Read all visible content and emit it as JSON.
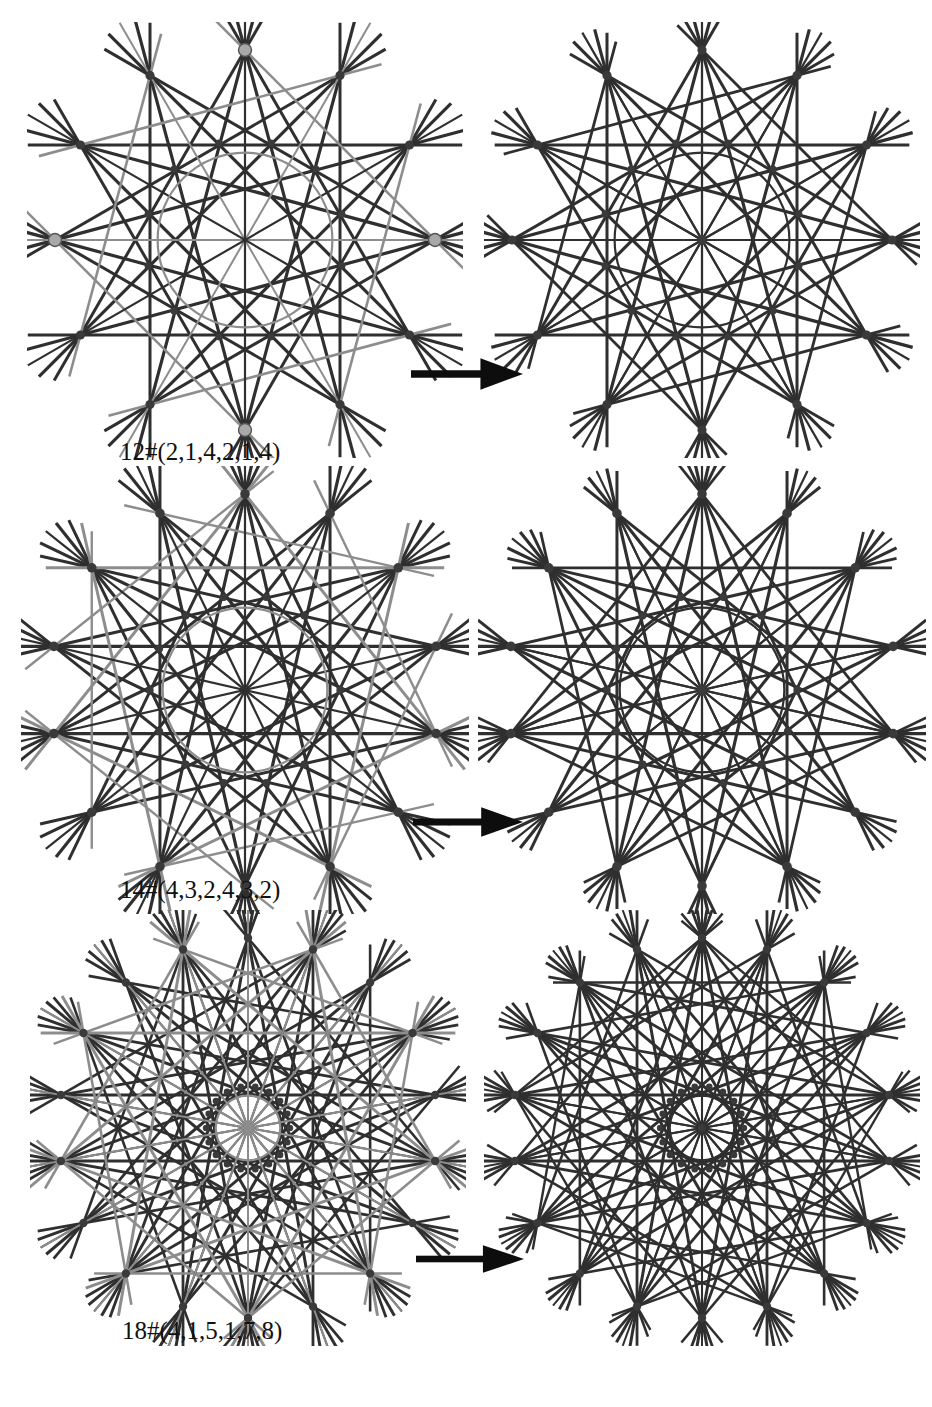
{
  "document": {
    "kind": "figure-plate",
    "background_color": "#ffffff",
    "width": 932,
    "height": 1407
  },
  "colors": {
    "dark_line": "#2f2f2f",
    "gray_line": "#8d8d8d",
    "light_gray_line": "#9a9a9a",
    "vertex_dark": "#3a3a3a",
    "vertex_light": "#a8a8a8",
    "vertex_light_stroke": "#555555",
    "arrow": "#0d0d0d",
    "caption": "#111111"
  },
  "arrow": {
    "name": "right-arrow",
    "glyph": "→"
  },
  "rows": [
    {
      "id": "row-1",
      "caption": "12#(2,1,4,2,1,4)",
      "symmetry": 12,
      "left": {
        "name": "arrangement-12-two-color",
        "cx": 245,
        "cy": 240,
        "r": 190,
        "n": 12,
        "rotation": -90,
        "inner_radius_ratio": 0.46,
        "extension": 0.16,
        "families": [
          {
            "name": "dark-chords-step-5",
            "color": "#2f2f2f",
            "width": 3.2,
            "step": 5,
            "indices": [
              0,
              1,
              2,
              3,
              4,
              5,
              6,
              7,
              8,
              9,
              10,
              11
            ]
          },
          {
            "name": "dark-chords-step-4",
            "color": "#2f2f2f",
            "width": 3.0,
            "step": 4,
            "indices": [
              0,
              1,
              2,
              3,
              4,
              5,
              6,
              7,
              8,
              9,
              10,
              11
            ]
          },
          {
            "name": "gray-chords-step-3",
            "color": "#8d8d8d",
            "width": 2.6,
            "step": 3,
            "indices": [
              0,
              2,
              4,
              6,
              8,
              10
            ]
          },
          {
            "name": "gray-axis-lines",
            "color": "#8d8d8d",
            "width": 2.0,
            "step": 6,
            "indices": [
              1,
              3,
              5,
              7,
              9,
              11
            ]
          },
          {
            "name": "dark-axis-lines",
            "color": "#2f2f2f",
            "width": 2.2,
            "step": 6,
            "indices": [
              0,
              2,
              4,
              6,
              8,
              10
            ]
          }
        ],
        "markers_light": [
          0,
          3,
          6,
          9
        ],
        "marker_light_r": 6.5,
        "marker_dark_r": 4.6
      },
      "right": {
        "name": "arrangement-12-unified",
        "cx": 702,
        "cy": 240,
        "r": 190,
        "n": 12,
        "rotation": -90,
        "inner_radius_ratio": 0.46,
        "extension": 0.13,
        "central_pencil": true,
        "families": [
          {
            "name": "dark-chords-step-5",
            "color": "#2f2f2f",
            "width": 3.2,
            "step": 5,
            "indices": [
              0,
              1,
              2,
              3,
              4,
              5,
              6,
              7,
              8,
              9,
              10,
              11
            ]
          },
          {
            "name": "dark-chords-step-4",
            "color": "#2f2f2f",
            "width": 3.0,
            "step": 4,
            "indices": [
              0,
              1,
              2,
              3,
              4,
              5,
              6,
              7,
              8,
              9,
              10,
              11
            ]
          },
          {
            "name": "dark-chords-step-3",
            "color": "#2f2f2f",
            "width": 2.8,
            "step": 3,
            "indices": [
              0,
              2,
              4,
              6,
              8,
              10
            ]
          },
          {
            "name": "dark-axis-lines",
            "color": "#2f2f2f",
            "width": 2.2,
            "step": 6,
            "indices": [
              0,
              1,
              2,
              3,
              4,
              5,
              6,
              7,
              8,
              9,
              10,
              11
            ]
          }
        ],
        "markers_light": [],
        "marker_light_r": 6.0,
        "marker_dark_r": 4.6
      },
      "arrow_box": {
        "x": 411,
        "y": 357,
        "w": 112,
        "h": 34
      }
    },
    {
      "id": "row-2",
      "caption": "14#(4,3,2,4,3,2)",
      "symmetry": 14,
      "left": {
        "name": "arrangement-14-two-color",
        "cx": 245,
        "cy": 690,
        "r": 196,
        "n": 14,
        "rotation": -90,
        "inner_radius_ratio": 0.42,
        "extension": 0.15,
        "families": [
          {
            "name": "dark-chords-step-6",
            "color": "#2f2f2f",
            "width": 3.2,
            "step": 6,
            "indices": [
              0,
              1,
              2,
              3,
              4,
              5,
              6,
              7,
              8,
              9,
              10,
              11,
              12,
              13
            ]
          },
          {
            "name": "dark-chords-step-5",
            "color": "#2f2f2f",
            "width": 3.0,
            "step": 5,
            "indices": [
              0,
              1,
              2,
              3,
              4,
              5,
              6,
              7,
              8,
              9,
              10,
              11,
              12,
              13
            ]
          },
          {
            "name": "gray-chords-step-4",
            "color": "#8d8d8d",
            "width": 3.0,
            "step": 4,
            "indices": [
              0,
              2,
              4,
              6,
              8,
              10,
              12
            ]
          },
          {
            "name": "gray-chords-step-3",
            "color": "#8d8d8d",
            "width": 2.4,
            "step": 3,
            "indices": [
              1,
              3,
              5,
              7,
              9,
              11,
              13
            ]
          },
          {
            "name": "dark-axis-lines",
            "color": "#2f2f2f",
            "width": 2.2,
            "step": 7,
            "indices": [
              0,
              1,
              2,
              3,
              4,
              5,
              6,
              7,
              8,
              9,
              10,
              11,
              12,
              13
            ]
          }
        ],
        "markers_light": [],
        "marker_light_r": 6.0,
        "marker_dark_r": 4.8
      },
      "right": {
        "name": "arrangement-14-unified",
        "cx": 702,
        "cy": 690,
        "r": 196,
        "n": 14,
        "rotation": -90,
        "inner_radius_ratio": 0.42,
        "extension": 0.12,
        "central_pencil": true,
        "families": [
          {
            "name": "dark-chords-step-6",
            "color": "#2f2f2f",
            "width": 3.2,
            "step": 6,
            "indices": [
              0,
              1,
              2,
              3,
              4,
              5,
              6,
              7,
              8,
              9,
              10,
              11,
              12,
              13
            ]
          },
          {
            "name": "dark-chords-step-5",
            "color": "#2f2f2f",
            "width": 3.0,
            "step": 5,
            "indices": [
              0,
              1,
              2,
              3,
              4,
              5,
              6,
              7,
              8,
              9,
              10,
              11,
              12,
              13
            ]
          },
          {
            "name": "dark-chords-step-4",
            "color": "#2f2f2f",
            "width": 2.8,
            "step": 4,
            "indices": [
              0,
              2,
              4,
              6,
              8,
              10,
              12
            ]
          },
          {
            "name": "dark-axis-lines",
            "color": "#2f2f2f",
            "width": 2.2,
            "step": 7,
            "indices": [
              0,
              1,
              2,
              3,
              4,
              5,
              6,
              7,
              8,
              9,
              10,
              11,
              12,
              13
            ]
          }
        ],
        "markers_light": [],
        "marker_light_r": 6.0,
        "marker_dark_r": 4.8
      },
      "arrow_box": {
        "x": 413,
        "y": 806,
        "w": 110,
        "h": 32
      }
    },
    {
      "id": "row-3",
      "caption": "18#(4,1,5,1,7,8)",
      "symmetry": 18,
      "left": {
        "name": "arrangement-18-two-color",
        "cx": 248,
        "cy": 1128,
        "r": 190,
        "n": 18,
        "rotation": -90,
        "inner_radius_ratio": 0.17,
        "extension": 0.13,
        "families": [
          {
            "name": "dark-chords-step-8",
            "color": "#2f2f2f",
            "width": 3.0,
            "step": 8,
            "indices": [
              0,
              1,
              2,
              3,
              4,
              5,
              6,
              7,
              8,
              9,
              10,
              11,
              12,
              13,
              14,
              15,
              16,
              17
            ]
          },
          {
            "name": "dark-chords-step-7",
            "color": "#2f2f2f",
            "width": 2.8,
            "step": 7,
            "indices": [
              0,
              1,
              2,
              3,
              4,
              5,
              6,
              7,
              8,
              9,
              10,
              11,
              12,
              13,
              14,
              15,
              16,
              17
            ]
          },
          {
            "name": "dark-chords-step-5",
            "color": "#2f2f2f",
            "width": 2.6,
            "step": 5,
            "indices": [
              0,
              2,
              4,
              6,
              8,
              10,
              12,
              14,
              16
            ]
          },
          {
            "name": "gray-chords-step-6",
            "color": "#8d8d8d",
            "width": 3.0,
            "step": 6,
            "indices": [
              1,
              3,
              5,
              7,
              9,
              11,
              13,
              15,
              17
            ]
          },
          {
            "name": "gray-chords-step-4",
            "color": "#8d8d8d",
            "width": 2.6,
            "step": 4,
            "indices": [
              1,
              3,
              5,
              7,
              9,
              11,
              13,
              15,
              17
            ]
          },
          {
            "name": "dark-axis-lines",
            "color": "#2f2f2f",
            "width": 2.0,
            "step": 9,
            "indices": [
              0,
              2,
              4,
              6,
              8,
              10,
              12,
              14,
              16
            ]
          },
          {
            "name": "gray-axis-lines",
            "color": "#8d8d8d",
            "width": 2.0,
            "step": 9,
            "indices": [
              1,
              3,
              5,
              7,
              9,
              11,
              13,
              15,
              17
            ]
          }
        ],
        "markers_light": [],
        "marker_light_r": 5.5,
        "marker_dark_r": 4.2
      },
      "right": {
        "name": "arrangement-18-unified",
        "cx": 702,
        "cy": 1128,
        "r": 190,
        "n": 18,
        "rotation": -90,
        "inner_radius_ratio": 0.17,
        "extension": 0.11,
        "central_pencil": true,
        "families": [
          {
            "name": "dark-chords-step-8",
            "color": "#2f2f2f",
            "width": 3.0,
            "step": 8,
            "indices": [
              0,
              1,
              2,
              3,
              4,
              5,
              6,
              7,
              8,
              9,
              10,
              11,
              12,
              13,
              14,
              15,
              16,
              17
            ]
          },
          {
            "name": "dark-chords-step-7",
            "color": "#2f2f2f",
            "width": 2.8,
            "step": 7,
            "indices": [
              0,
              1,
              2,
              3,
              4,
              5,
              6,
              7,
              8,
              9,
              10,
              11,
              12,
              13,
              14,
              15,
              16,
              17
            ]
          },
          {
            "name": "dark-chords-step-5",
            "color": "#2f2f2f",
            "width": 2.6,
            "step": 5,
            "indices": [
              0,
              1,
              2,
              3,
              4,
              5,
              6,
              7,
              8,
              9,
              10,
              11,
              12,
              13,
              14,
              15,
              16,
              17
            ]
          },
          {
            "name": "dark-chords-step-4",
            "color": "#2f2f2f",
            "width": 2.4,
            "step": 4,
            "indices": [
              0,
              2,
              4,
              6,
              8,
              10,
              12,
              14,
              16
            ]
          },
          {
            "name": "dark-axis-lines",
            "color": "#2f2f2f",
            "width": 2.0,
            "step": 9,
            "indices": [
              0,
              1,
              2,
              3,
              4,
              5,
              6,
              7,
              8,
              9,
              10,
              11,
              12,
              13,
              14,
              15,
              16,
              17
            ]
          }
        ],
        "markers_light": [],
        "marker_light_r": 5.5,
        "marker_dark_r": 4.2
      },
      "arrow_box": {
        "x": 416,
        "y": 1244,
        "w": 108,
        "h": 30
      }
    }
  ],
  "captions_positions": [
    {
      "x": 120,
      "y": 438
    },
    {
      "x": 120,
      "y": 876
    },
    {
      "x": 122,
      "y": 1317
    }
  ]
}
